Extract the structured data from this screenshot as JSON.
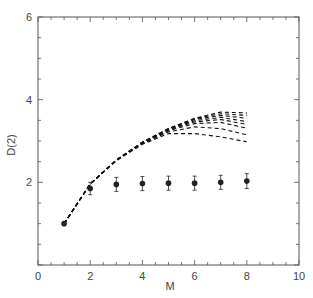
{
  "chart_data": {
    "type": "line",
    "title": "",
    "xlabel": "M",
    "ylabel": "D(2)",
    "xlim": [
      0,
      10
    ],
    "ylim": [
      0,
      6
    ],
    "x_major_ticks": [
      0,
      2,
      4,
      6,
      8,
      10
    ],
    "y_major_ticks": [
      2,
      4,
      6
    ],
    "x_minor_step": 0.5,
    "y_minor_step": 0.5,
    "grid": false,
    "legend": null,
    "x": [
      1,
      2,
      3,
      4,
      5,
      6,
      7,
      8
    ],
    "points": {
      "name": "data (with error bars)",
      "style": "filled-circle",
      "values": [
        1.0,
        1.85,
        1.95,
        1.97,
        1.98,
        1.98,
        2.0,
        2.03
      ],
      "errors": [
        0.0,
        0.15,
        0.17,
        0.17,
        0.17,
        0.17,
        0.17,
        0.18
      ]
    },
    "series": [
      {
        "name": "curve-1",
        "style": "dashed",
        "values": [
          1.0,
          1.96,
          2.54,
          2.97,
          3.3,
          3.55,
          3.7,
          3.68
        ]
      },
      {
        "name": "curve-2",
        "style": "dashed",
        "values": [
          1.0,
          1.96,
          2.54,
          2.97,
          3.3,
          3.54,
          3.66,
          3.62
        ]
      },
      {
        "name": "curve-3",
        "style": "dashed",
        "values": [
          1.0,
          1.96,
          2.54,
          2.97,
          3.29,
          3.52,
          3.62,
          3.55
        ]
      },
      {
        "name": "curve-4",
        "style": "dashed",
        "values": [
          1.0,
          1.96,
          2.54,
          2.96,
          3.28,
          3.49,
          3.57,
          3.47
        ]
      },
      {
        "name": "curve-5",
        "style": "dashed",
        "values": [
          1.0,
          1.96,
          2.54,
          2.96,
          3.27,
          3.46,
          3.52,
          3.4
        ]
      },
      {
        "name": "curve-6",
        "style": "dashed",
        "values": [
          1.0,
          1.96,
          2.54,
          2.95,
          3.25,
          3.42,
          3.45,
          3.31
        ]
      },
      {
        "name": "curve-7",
        "style": "dashed",
        "values": [
          1.0,
          1.96,
          2.53,
          2.94,
          3.22,
          3.34,
          3.3,
          3.15
        ]
      },
      {
        "name": "curve-8",
        "style": "dashed",
        "values": [
          1.0,
          1.96,
          2.52,
          2.92,
          3.18,
          3.18,
          3.1,
          2.98
        ]
      }
    ]
  },
  "axis": {
    "x_label": "M",
    "y_label": "D(2)",
    "x_tick_labels": [
      "0",
      "2",
      "4",
      "6",
      "8",
      "10"
    ],
    "y_tick_labels": [
      "2",
      "4",
      "6"
    ]
  },
  "colors": {
    "axis": "#555555",
    "curve": "#111111",
    "point": "#222222",
    "text": "#444444"
  }
}
